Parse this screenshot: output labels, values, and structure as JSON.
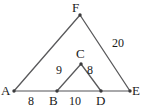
{
  "figure": {
    "type": "geometry-diagram",
    "stroke_color": "#59595b",
    "label_color": "#1a1a1a",
    "background_color": "#ffffff"
  },
  "vertices": [
    {
      "id": "A",
      "label": "A",
      "x": 14,
      "y": 91,
      "label_x": 1,
      "label_y": 84
    },
    {
      "id": "B",
      "label": "B",
      "x": 57,
      "y": 91,
      "label_x": 49,
      "label_y": 94
    },
    {
      "id": "C",
      "label": "C",
      "x": 81,
      "y": 64,
      "label_x": 76,
      "label_y": 47
    },
    {
      "id": "D",
      "label": "D",
      "x": 101,
      "y": 91,
      "label_x": 96,
      "label_y": 94
    },
    {
      "id": "E",
      "label": "E",
      "x": 130,
      "y": 91,
      "label_x": 132,
      "label_y": 84
    },
    {
      "id": "F",
      "label": "F",
      "x": 80,
      "y": 15,
      "label_x": 72,
      "label_y": 1
    }
  ],
  "edges": [
    {
      "id": "A-F",
      "from": "A",
      "to": "F"
    },
    {
      "id": "F-E",
      "from": "F",
      "to": "E"
    },
    {
      "id": "A-E",
      "from": "A",
      "to": "E"
    },
    {
      "id": "B-C",
      "from": "B",
      "to": "C"
    },
    {
      "id": "C-D",
      "from": "C",
      "to": "D"
    }
  ],
  "measurements": [
    {
      "id": "AB",
      "value": "8",
      "edge": "A-B",
      "x": 28,
      "y": 95
    },
    {
      "id": "BD",
      "value": "10",
      "edge": "B-D",
      "x": 69,
      "y": 95
    },
    {
      "id": "BC",
      "value": "9",
      "edge": "B-C",
      "x": 56,
      "y": 64
    },
    {
      "id": "CD",
      "value": "8",
      "edge": "C-D",
      "x": 87,
      "y": 64
    },
    {
      "id": "FE",
      "value": "20",
      "edge": "F-E",
      "x": 112,
      "y": 37
    }
  ]
}
